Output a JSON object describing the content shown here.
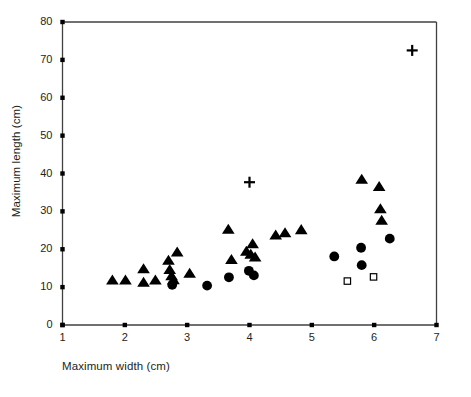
{
  "chart_data": {
    "type": "scatter",
    "title": "",
    "xlabel": "Maximum width (cm)",
    "ylabel": "Maximum length (cm)",
    "xlim": [
      1,
      7
    ],
    "ylim": [
      0,
      80
    ],
    "xticks": [
      1,
      2,
      3,
      4,
      5,
      6,
      7
    ],
    "yticks": [
      0,
      10,
      20,
      30,
      40,
      50,
      60,
      70,
      80
    ],
    "grid": false,
    "legend": "none",
    "series": [
      {
        "name": "filled-triangle",
        "marker": "triangle",
        "fill": "#000000",
        "points": [
          [
            1.8,
            11.8
          ],
          [
            2.01,
            11.8
          ],
          [
            2.3,
            14.8
          ],
          [
            2.3,
            11.2
          ],
          [
            2.49,
            11.8
          ],
          [
            2.7,
            17.0
          ],
          [
            2.72,
            14.6
          ],
          [
            2.75,
            12.9
          ],
          [
            2.78,
            11.9
          ],
          [
            2.84,
            19.2
          ],
          [
            3.04,
            13.6
          ],
          [
            3.66,
            25.2
          ],
          [
            3.71,
            17.2
          ],
          [
            3.95,
            19.4
          ],
          [
            4.02,
            18.6
          ],
          [
            4.05,
            21.4
          ],
          [
            4.09,
            17.9
          ],
          [
            4.42,
            23.7
          ],
          [
            4.57,
            24.3
          ],
          [
            4.83,
            25.1
          ],
          [
            5.8,
            38.4
          ],
          [
            6.08,
            36.5
          ],
          [
            6.1,
            30.6
          ],
          [
            6.12,
            27.6
          ]
        ]
      },
      {
        "name": "filled-circle",
        "marker": "circle",
        "fill": "#000000",
        "points": [
          [
            2.76,
            10.6
          ],
          [
            3.32,
            10.4
          ],
          [
            3.67,
            12.6
          ],
          [
            3.99,
            14.3
          ],
          [
            4.07,
            13.1
          ],
          [
            5.36,
            18.1
          ],
          [
            5.79,
            20.4
          ],
          [
            5.8,
            15.8
          ],
          [
            6.25,
            22.8
          ]
        ]
      },
      {
        "name": "open-square",
        "marker": "square",
        "fill": "none",
        "points": [
          [
            5.57,
            11.6
          ],
          [
            5.99,
            12.7
          ]
        ]
      },
      {
        "name": "plus",
        "marker": "plus",
        "fill": "#000000",
        "points": [
          [
            4.0,
            37.7
          ],
          [
            6.61,
            72.5
          ]
        ]
      }
    ]
  },
  "axes": {
    "x_tick_labels": [
      "1",
      "2",
      "3",
      "4",
      "5",
      "6",
      "7"
    ],
    "y_tick_labels": [
      "0",
      "10",
      "20",
      "30",
      "40",
      "50",
      "60",
      "70",
      "80"
    ],
    "x_axis_title": "Maximum width (cm)",
    "y_axis_title": "Maximum length (cm)"
  },
  "style": {
    "axis_color": "#404040",
    "marker_color": "#000000",
    "background": "#ffffff"
  }
}
